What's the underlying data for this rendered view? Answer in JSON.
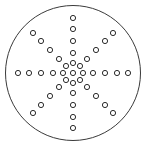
{
  "figure": {
    "title": "Circular peg solitaire board",
    "background_color": "#ffffff"
  },
  "board": {
    "name": "circular-board",
    "outline_color": "#3a3a3a",
    "outline_width": 1,
    "fill_color": "#ffffff",
    "center_x": 73,
    "center_y": 73,
    "radius": 67.5
  },
  "hole_style": {
    "fill_color": "#ffffff",
    "stroke_color": "#2b2b2b",
    "stroke_width": 1,
    "radius": 2.6
  },
  "counts": {
    "arms": 8,
    "holes_per_arm": 4,
    "center_ring_holes": 8,
    "center_hub_holes": 1,
    "total_holes": 41
  },
  "chart_data": {
    "type": "scatter",
    "title": "Circular peg solitaire board",
    "xlabel": "",
    "ylabel": "",
    "xlim": [
      0,
      147
    ],
    "ylim": [
      0,
      151
    ],
    "grid": false,
    "legend": "none",
    "series": [
      {
        "name": "center-hub",
        "points": [
          {
            "x": 73,
            "y": 73
          }
        ]
      },
      {
        "name": "center-ring",
        "points": [
          {
            "x": 73,
            "y": 63
          },
          {
            "x": 80,
            "y": 66
          },
          {
            "x": 83,
            "y": 73
          },
          {
            "x": 80,
            "y": 80
          },
          {
            "x": 73,
            "y": 83
          },
          {
            "x": 66,
            "y": 80
          },
          {
            "x": 63,
            "y": 73
          },
          {
            "x": 66,
            "y": 66
          }
        ]
      },
      {
        "name": "arm-north",
        "points": [
          {
            "x": 73,
            "y": 53
          },
          {
            "x": 73,
            "y": 41
          },
          {
            "x": 73,
            "y": 29
          },
          {
            "x": 73,
            "y": 18
          }
        ]
      },
      {
        "name": "arm-northeast",
        "points": [
          {
            "x": 87,
            "y": 59
          },
          {
            "x": 96,
            "y": 50
          },
          {
            "x": 105,
            "y": 41
          },
          {
            "x": 113,
            "y": 33
          }
        ]
      },
      {
        "name": "arm-east",
        "points": [
          {
            "x": 93,
            "y": 73
          },
          {
            "x": 105,
            "y": 73
          },
          {
            "x": 117,
            "y": 73
          },
          {
            "x": 128,
            "y": 73
          }
        ]
      },
      {
        "name": "arm-southeast",
        "points": [
          {
            "x": 87,
            "y": 87
          },
          {
            "x": 96,
            "y": 96
          },
          {
            "x": 105,
            "y": 105
          },
          {
            "x": 113,
            "y": 113
          }
        ]
      },
      {
        "name": "arm-south",
        "points": [
          {
            "x": 73,
            "y": 93
          },
          {
            "x": 73,
            "y": 105
          },
          {
            "x": 73,
            "y": 117
          },
          {
            "x": 73,
            "y": 128
          }
        ]
      },
      {
        "name": "arm-southwest",
        "points": [
          {
            "x": 59,
            "y": 87
          },
          {
            "x": 50,
            "y": 96
          },
          {
            "x": 41,
            "y": 105
          },
          {
            "x": 33,
            "y": 113
          }
        ]
      },
      {
        "name": "arm-west",
        "points": [
          {
            "x": 53,
            "y": 73
          },
          {
            "x": 41,
            "y": 73
          },
          {
            "x": 29,
            "y": 73
          },
          {
            "x": 18,
            "y": 73
          }
        ]
      },
      {
        "name": "arm-northwest",
        "points": [
          {
            "x": 59,
            "y": 59
          },
          {
            "x": 50,
            "y": 50
          },
          {
            "x": 41,
            "y": 41
          },
          {
            "x": 33,
            "y": 33
          }
        ]
      }
    ]
  }
}
